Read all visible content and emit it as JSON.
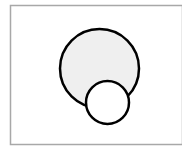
{
  "diagram": {
    "frame": {
      "x": 10.5,
      "y": 5.5,
      "width": 172,
      "height": 139,
      "stroke": "#a8a8a8"
    },
    "large_circle": {
      "cx": 99.5,
      "cy": 68.5,
      "r": 39.5,
      "fill": "#efefef",
      "stroke": "#000000"
    },
    "small_circle": {
      "cx": 107.5,
      "cy": 102.5,
      "r": 21.5,
      "fill": "#ffffff",
      "stroke": "#000000"
    }
  }
}
